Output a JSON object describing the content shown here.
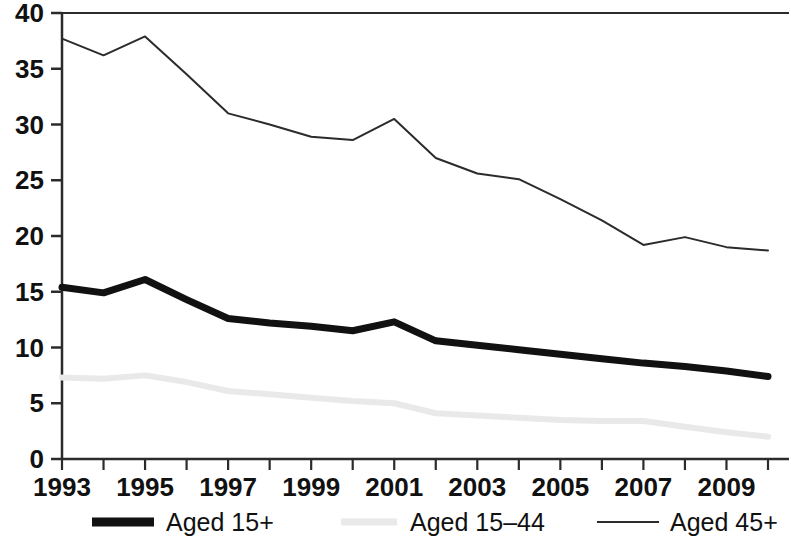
{
  "chart_data": {
    "type": "line",
    "title": "",
    "subtitle": "",
    "xlabel": "",
    "ylabel": "",
    "x": [
      1993,
      1994,
      1995,
      1996,
      1997,
      1998,
      1999,
      2000,
      2001,
      2002,
      2003,
      2004,
      2005,
      2006,
      2007,
      2008,
      2009,
      2010
    ],
    "xlim": [
      1993,
      2010
    ],
    "ylim": [
      0,
      40
    ],
    "yticks": [
      0,
      5,
      10,
      15,
      20,
      25,
      30,
      35,
      40
    ],
    "ytick_labels": [
      "0",
      "5",
      "10",
      "15",
      "20",
      "25",
      "30",
      "35",
      "40"
    ],
    "xticks": [
      1993,
      1994,
      1995,
      1996,
      1997,
      1998,
      1999,
      2000,
      2001,
      2002,
      2003,
      2004,
      2005,
      2006,
      2007,
      2008,
      2009,
      2010
    ],
    "xtick_labels": [
      "1993",
      "",
      "1995",
      "",
      "1997",
      "",
      "1999",
      "",
      "2001",
      "",
      "2003",
      "",
      "2005",
      "",
      "2007",
      "",
      "2009",
      ""
    ],
    "xtick_labels_shown": [
      "1993",
      "1995",
      "1997",
      "1999",
      "2001",
      "2003",
      "2005",
      "2007",
      "2009"
    ],
    "grid": false,
    "legend_position": "bottom",
    "series": [
      {
        "name": "Aged 15+",
        "style": "thick-solid-black",
        "color": "#111111",
        "width": 7,
        "values": [
          15.4,
          14.9,
          16.1,
          14.3,
          12.6,
          12.2,
          11.9,
          11.5,
          12.3,
          10.6,
          10.2,
          9.8,
          9.4,
          9.0,
          8.6,
          8.3,
          7.9,
          7.4
        ]
      },
      {
        "name": "Aged 15–44",
        "style": "thick-solid-lightgray",
        "color": "#e9e9e9",
        "width": 6,
        "values": [
          7.3,
          7.2,
          7.5,
          6.9,
          6.1,
          5.8,
          5.5,
          5.2,
          5.0,
          4.1,
          3.9,
          3.7,
          3.5,
          3.4,
          3.4,
          2.9,
          2.4,
          2.0
        ]
      },
      {
        "name": "Aged 45+",
        "style": "thin-solid-black",
        "color": "#2b2b2b",
        "width": 2,
        "values": [
          37.7,
          36.2,
          37.9,
          34.5,
          31.0,
          30.0,
          28.9,
          28.6,
          30.5,
          27.0,
          25.6,
          25.1,
          23.3,
          21.4,
          19.2,
          19.9,
          19.0,
          18.7
        ]
      }
    ],
    "legend": [
      {
        "label": "Aged 15+",
        "style": "thick-solid-black",
        "color": "#111111"
      },
      {
        "label": "Aged 15–44",
        "style": "thick-solid-lightgray",
        "color": "#e9e9e9"
      },
      {
        "label": "Aged 45+",
        "style": "thin-solid-black",
        "color": "#2b2b2b"
      }
    ]
  },
  "axes": {
    "y_tick_labels": [
      "40",
      "35",
      "30",
      "25",
      "20",
      "15",
      "10",
      "5",
      "0"
    ],
    "x_tick_labels": [
      "1993",
      "1995",
      "1997",
      "1999",
      "2001",
      "2003",
      "2005",
      "2007",
      "2009"
    ]
  }
}
